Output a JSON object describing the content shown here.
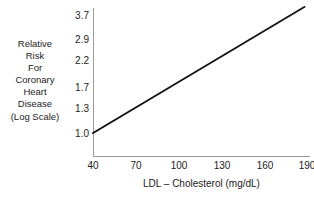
{
  "chart_data": {
    "type": "line",
    "title": "",
    "xlabel": "LDL – Cholesterol (mg/dL)",
    "ylabel_lines": [
      "Relative",
      "Risk",
      "For",
      "Coronary",
      "Heart",
      "Disease",
      "(Log Scale)"
    ],
    "ylabel": "Relative Risk For Coronary Heart Disease (Log Scale)",
    "x_ticks": [
      "40",
      "70",
      "100",
      "130",
      "160",
      "190"
    ],
    "x_tick_values": [
      40,
      70,
      100,
      130,
      160,
      190
    ],
    "y_ticks": [
      "1.0",
      "1.3",
      "1.7",
      "2.2",
      "2.9",
      "3.7"
    ],
    "y_tick_values": [
      1.0,
      1.3,
      1.7,
      2.2,
      2.9,
      3.7
    ],
    "y_scale": "log",
    "xlim": [
      40,
      205
    ],
    "ylim": [
      1.0,
      4.0
    ],
    "grid": false,
    "legend": null,
    "series": [
      {
        "name": "Relative risk of coronary heart disease",
        "x": [
          40,
          70,
          100,
          130,
          160,
          190,
          203
        ],
        "values": [
          1.0,
          1.3,
          1.7,
          2.2,
          2.9,
          3.7,
          4.05
        ],
        "color": "#111111"
      }
    ],
    "line_color": "#111111",
    "axis_color": "#9a9a9a",
    "background": "#ffffff"
  },
  "figure": {
    "xlabel": "LDL – Cholesterol (mg/dL)"
  }
}
